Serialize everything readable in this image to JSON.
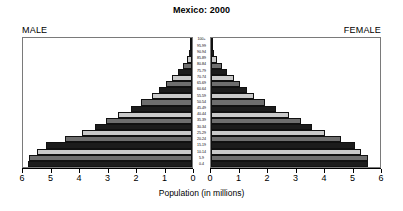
{
  "chart_data": {
    "type": "bar",
    "subtype": "population-pyramid",
    "title": "Mexico: 2000",
    "xlabel": "Population (in millions)",
    "ylabel": "",
    "xlim": [
      0,
      6
    ],
    "xticks": [
      0,
      1,
      2,
      3,
      4,
      5,
      6
    ],
    "left_axis_ticklabels": [
      "6",
      "5",
      "4",
      "3",
      "2",
      "1",
      "0"
    ],
    "right_axis_ticklabels": [
      "0",
      "1",
      "2",
      "3",
      "4",
      "5",
      "6"
    ],
    "grid": false,
    "legend": "none",
    "side_labels": {
      "left": "MALE",
      "right": "FEMALE"
    },
    "categories": [
      "0-4",
      "5-9",
      "10-14",
      "15-19",
      "20-24",
      "25-29",
      "30-34",
      "35-39",
      "40-44",
      "45-49",
      "50-54",
      "55-59",
      "60-64",
      "65-69",
      "70-74",
      "75-79",
      "80-84",
      "85-89",
      "90-94",
      "95-99",
      "100+"
    ],
    "series": [
      {
        "name": "MALE",
        "side": "left",
        "values": [
          5.82,
          5.78,
          5.52,
          5.18,
          4.52,
          3.92,
          3.44,
          3.06,
          2.62,
          2.18,
          1.8,
          1.42,
          1.16,
          0.92,
          0.7,
          0.5,
          0.32,
          0.19,
          0.1,
          0.04,
          0.02
        ]
      },
      {
        "name": "FEMALE",
        "side": "right",
        "values": [
          5.58,
          5.56,
          5.34,
          5.12,
          4.62,
          4.06,
          3.58,
          3.2,
          2.76,
          2.3,
          1.92,
          1.54,
          1.28,
          1.02,
          0.8,
          0.58,
          0.38,
          0.23,
          0.12,
          0.05,
          0.02
        ]
      }
    ],
    "bar_palette": [
      "#1c1c1c",
      "#6e6e6e",
      "#c9c9c9"
    ]
  }
}
